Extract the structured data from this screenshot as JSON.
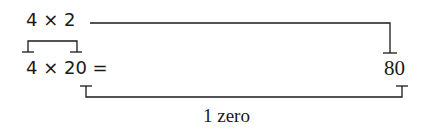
{
  "diagram": {
    "top_expression": "4 × 2",
    "main_expression": "4 × 20 =",
    "result": "80",
    "annotation": "1 zero"
  },
  "colors": {
    "ink": "#1a1a1a",
    "background": "#ffffff"
  }
}
